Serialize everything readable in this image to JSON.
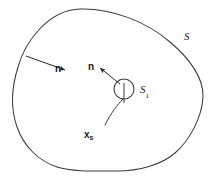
{
  "figure": {
    "type": "diagram",
    "background_color": "#ffffff",
    "stroke_color": "#3a3a3a",
    "text_color": "#1a1a1a",
    "labels": {
      "outer_normal": "n",
      "inner_normal": "n",
      "outer_surface": "S",
      "inner_surface_base": "S",
      "inner_surface_sub": "1",
      "source_point_base": "x",
      "source_point_sub": "s"
    },
    "geometry": {
      "outer_boundary_path": "M 80 9 C 120 9 160 27 184 52 C 200 69 205 86 203 102 C 201 122 190 141 176 155 C 163 168 142 172 118 171 C 95 170 72 171 56 166 C 38 161 24 146 17 126 C 11 108 13 88 18 69 C 24 44 45 9 80 9 Z",
      "inner_circle": {
        "cx": 124,
        "cy": 90,
        "r": 10
      },
      "inner_tick": {
        "x1": 124,
        "y1": 84,
        "x2": 124,
        "y2": 104
      },
      "outer_normal_arrow": {
        "x1": 27,
        "y1": 56,
        "x2": 66,
        "y2": 70
      },
      "inner_normal_arrow": {
        "x1": 120,
        "y1": 84,
        "x2": 99,
        "y2": 68
      },
      "source_ray_path": "M 106 124 C 112 112 118 106 123 100"
    }
  }
}
